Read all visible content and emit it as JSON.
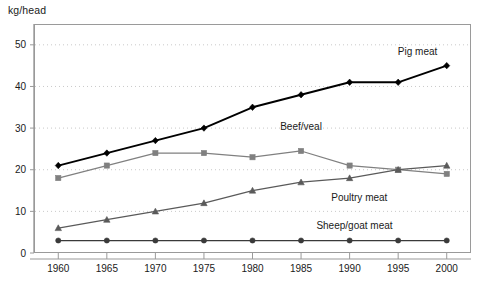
{
  "chart_data": {
    "type": "line",
    "title": "",
    "subtitle": "",
    "xlabel": "",
    "ylabel": "kg/head",
    "unit_label": "kg/head",
    "categories": [
      1960,
      1965,
      1970,
      1975,
      1980,
      1985,
      1990,
      1995,
      2000
    ],
    "xtick_labels": [
      "1960",
      "1965",
      "1970",
      "1975",
      "1980",
      "1985",
      "1990",
      "1995",
      "2000"
    ],
    "ytick_labels": [
      "0",
      "10",
      "20",
      "30",
      "40",
      "50"
    ],
    "yticks": [
      0,
      10,
      20,
      30,
      40,
      50
    ],
    "ylim": [
      0,
      55
    ],
    "xlim": [
      1957.5,
      2002.5
    ],
    "grid": true,
    "grid_style": "dotted-horizontal",
    "legend_position": "inline-annotations",
    "series": [
      {
        "name": "Pig meat",
        "label": "Pig meat",
        "color": "#000000",
        "marker": "diamond",
        "label_x": 1997.0,
        "label_y": 47.5,
        "values": [
          21,
          24,
          27,
          30,
          35,
          38,
          41,
          41,
          45
        ]
      },
      {
        "name": "Beef/veal",
        "label": "Beef/veal",
        "color": "#808080",
        "marker": "square",
        "label_x": 1985.0,
        "label_y": 29.5,
        "values": [
          18,
          21,
          24,
          24,
          23,
          24.5,
          21,
          20,
          19
        ]
      },
      {
        "name": "Poultry meat",
        "label": "Poultry meat",
        "color": "#5a5a5a",
        "marker": "triangle",
        "label_x": 1991.0,
        "label_y": 12.5,
        "values": [
          6,
          8,
          10,
          12,
          15,
          17,
          18,
          20,
          21
        ]
      },
      {
        "name": "Sheep/goat meat",
        "label": "Sheep/goat meat",
        "color": "#3a3a3a",
        "marker": "circle",
        "label_x": 1990.5,
        "label_y": 5.8,
        "values": [
          3,
          3,
          3,
          3,
          3,
          3,
          3,
          3,
          3
        ]
      }
    ],
    "colors": {
      "axis": "#9a9a9a",
      "grid": "#c9c9c9",
      "text": "#1a1a1a",
      "background": "#ffffff"
    }
  }
}
